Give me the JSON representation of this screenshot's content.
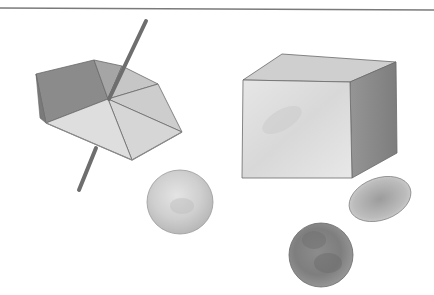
{
  "image": {
    "description": "Watercolor illustration of geometric solids: a spinning top (hexagonal pyramid on a stick), a cube, and three rounded shapes (two discs/spheres and an ellipsoid)",
    "colors": {
      "background": "#ffffff",
      "top_rule": "#7a7a7a",
      "stick": "#6e6e6e",
      "top_dark": "#8a8a8a",
      "top_mid": "#a9a9a9",
      "top_light": "#d8d8d8",
      "cube_front": "#e2e2e2",
      "cube_top": "#cfcfcf",
      "cube_side": "#8c8c8c",
      "sphere_light": "#d0d0d0",
      "sphere_dark": "#8a8a8a",
      "ellipsoid": "#b4b4b4"
    },
    "objects": [
      {
        "name": "spinning-top",
        "label": "Spinning top"
      },
      {
        "name": "cube",
        "label": "Cube"
      },
      {
        "name": "light-sphere",
        "label": "Light sphere"
      },
      {
        "name": "ellipsoid",
        "label": "Ellipsoid"
      },
      {
        "name": "dark-sphere",
        "label": "Dark sphere"
      }
    ]
  }
}
